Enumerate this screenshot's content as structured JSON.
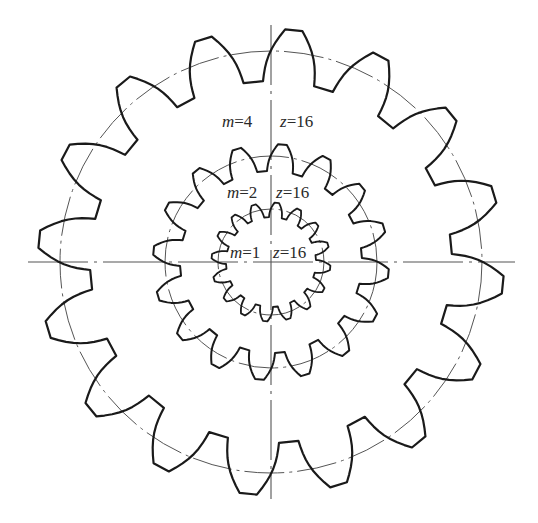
{
  "diagram": {
    "title": "",
    "center": {
      "x": 271,
      "y": 262
    },
    "colors": {
      "gear_line": "#1a1a1a",
      "center_line": "#555555",
      "text": "#2a2a2a",
      "background": "#ffffff"
    },
    "axes": {
      "horizontal": {
        "x1": 28,
        "x2": 515,
        "y": 262
      },
      "vertical": {
        "x": 271,
        "y1": 25,
        "y2": 499
      }
    },
    "gears": [
      {
        "id": "gear-m4",
        "module": 4,
        "teeth": 16,
        "pitch_radius": 211,
        "addendum": 22,
        "dedendum": 30,
        "stroke_width": 2.2
      },
      {
        "id": "gear-m2",
        "module": 2,
        "teeth": 16,
        "pitch_radius": 106,
        "addendum": 12,
        "dedendum": 15,
        "stroke_width": 2.0
      },
      {
        "id": "gear-m1",
        "module": 1,
        "teeth": 16,
        "pitch_radius": 53,
        "addendum": 6.5,
        "dedendum": 8,
        "stroke_width": 1.8
      }
    ],
    "labels": [
      {
        "m_label": "m",
        "m_value": "=4",
        "z_label": "z",
        "z_value": "=16",
        "m_x": 222,
        "z_x": 280,
        "y": 113
      },
      {
        "m_label": "m",
        "m_value": "=2",
        "z_label": "z",
        "z_value": "=16",
        "m_x": 227,
        "z_x": 276,
        "y": 184
      },
      {
        "m_label": "m",
        "m_value": "=1",
        "z_label": "z",
        "z_value": "=16",
        "m_x": 230,
        "z_x": 273,
        "y": 244
      }
    ]
  }
}
